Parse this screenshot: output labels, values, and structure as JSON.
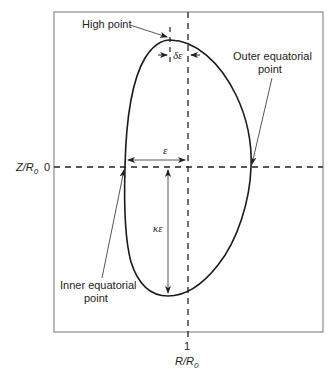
{
  "diagram": {
    "type": "plasma-cross-section",
    "axes": {
      "x_label": "R/R",
      "x_label_sub": "0",
      "x_tick": "1",
      "y_label": "Z/R",
      "y_label_sub": "0",
      "y_tick": "0"
    },
    "annotations": {
      "high_point": "High point",
      "outer_line1": "Outer equatorial",
      "outer_line2": "point",
      "inner_line1": "Inner equatorial",
      "inner_line2": "point",
      "delta_eps": "δε",
      "eps": "ε",
      "kappa_eps": "κε"
    },
    "colors": {
      "curve": "#1a1a1a",
      "frame": "#8a8a8a",
      "dashed": "#222222",
      "arrow": "#444444"
    }
  }
}
